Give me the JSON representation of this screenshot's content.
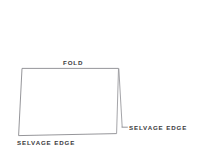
{
  "diagram": {
    "background_color": "#ffffff",
    "line_color": "#8a8a8e",
    "line_color_dark": "#6e6e73",
    "text_color": "#3a3a3c",
    "labels": {
      "fold": "FOLD",
      "selvage_edge_right": "SELVAGE EDGE",
      "selvage_edge_bottom": "SELVAGE EDGE"
    },
    "shapes": {
      "front_panel": {
        "name": "front-panel-quadrilateral",
        "points": "22,68 118.5,68 116.5,133.5 18.5,135.5"
      },
      "fold_crease": {
        "name": "fold-crease-line",
        "points": "118.5,68 122,127"
      },
      "selvage_tick": {
        "name": "selvage-edge-tick",
        "points": "122,127 127.5,127"
      }
    }
  }
}
